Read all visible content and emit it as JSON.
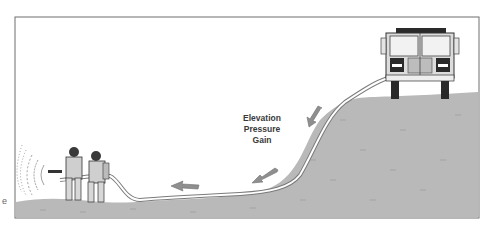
{
  "diagram": {
    "title": "Elevation Pressure Gain",
    "label_lines": [
      "Elevation",
      "Pressure",
      "Gain"
    ],
    "edge_fragment": "e",
    "elements": {
      "truck": "fire-engine-front-view",
      "hose": "hose-line-downhill",
      "crew": [
        "firefighter-nozzle",
        "firefighter-backup"
      ],
      "water": "water-spray-pattern",
      "arrows": [
        "arrow-down-slope-upper",
        "arrow-down-slope-lower",
        "arrow-left-flat"
      ]
    },
    "colors": {
      "ground": "#b9b9b9",
      "ground_dark": "#9e9e9e",
      "frame": "#6e6e6e",
      "sky": "#ffffff",
      "arrow": "#8f8f8f",
      "truck_body": "#dcdcdc",
      "truck_dark": "#2a2a2a"
    }
  }
}
